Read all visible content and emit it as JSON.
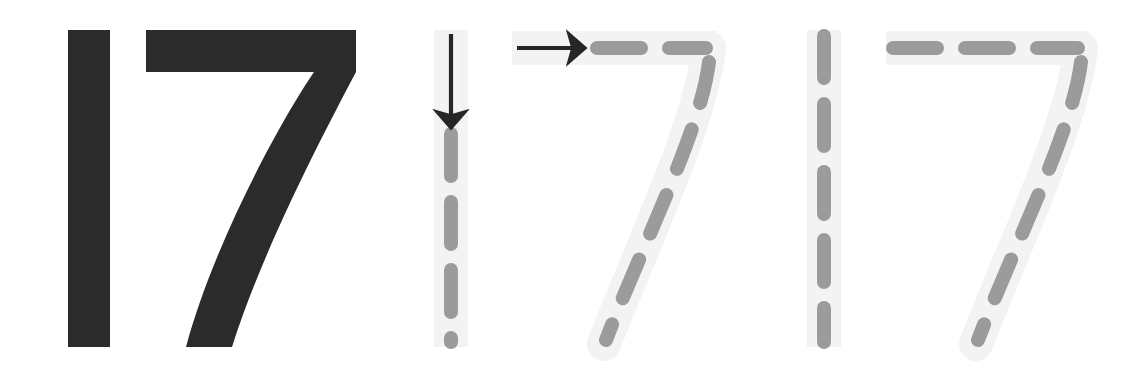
{
  "worksheet": {
    "title": "17",
    "number_word": "seventeen",
    "digits": [
      "1",
      "7"
    ],
    "background_color": "#ffffff",
    "solid_color": "#2b2b2b",
    "dash_color": "#9b9b9b",
    "guide_band_color": "#f3f3f3",
    "arrow_color": "#262626",
    "panels": [
      {
        "id": "panel-model",
        "label": "solid model numeral",
        "style": "solid",
        "shows_arrows": false,
        "x": 0,
        "width": 400
      },
      {
        "id": "panel-traced-guided",
        "label": "dashed tracing numeral with stroke-direction arrows",
        "style": "dashed",
        "shows_arrows": true,
        "x": 400,
        "width": 380
      },
      {
        "id": "panel-traced",
        "label": "dashed tracing numeral",
        "style": "dashed",
        "shows_arrows": false,
        "x": 780,
        "width": 358
      }
    ],
    "strokes": [
      {
        "digit": "1",
        "stroke_index": 1,
        "name": "vertical-downstroke",
        "direction": "down",
        "arrow": "arrow-down",
        "dash_count_guided": 4,
        "dash_count_plain": 5
      },
      {
        "digit": "7",
        "stroke_index": 1,
        "name": "horizontal-topstroke",
        "direction": "right",
        "arrow": "arrow-right",
        "dash_count_guided": 2,
        "dash_count_plain": 3
      },
      {
        "digit": "7",
        "stroke_index": 2,
        "name": "diagonal-downstroke",
        "direction": "down-left",
        "arrow": "none",
        "dash_count_guided": 5,
        "dash_count_plain": 5
      }
    ],
    "geometry": {
      "top_y": 30,
      "bottom_y": 347,
      "stroke_weight_solid": 42,
      "stroke_weight_dash": 14,
      "guide_band_weight": 34,
      "dash_length_vertical": 42,
      "dash_gap_vertical": 26
    }
  }
}
